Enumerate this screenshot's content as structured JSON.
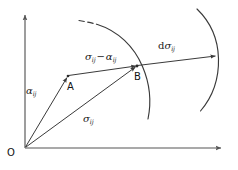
{
  "figure": {
    "background": "#ffffff",
    "stroke_color": "#3a3a3a",
    "axis_color": "#555555",
    "text_color": "#1a1a1a",
    "width": 238,
    "height": 170
  },
  "axes": {
    "origin_label": "O",
    "vertical": {
      "name": "vertical-axis",
      "from": [
        25,
        148
      ],
      "to": [
        25,
        14
      ]
    },
    "horizontal": {
      "name": "horizontal-axis",
      "from": [
        25,
        148
      ],
      "to": [
        222,
        148
      ]
    }
  },
  "points": {
    "origin": {
      "label": "O",
      "x": 25,
      "y": 148
    },
    "a": {
      "label": "A",
      "x": 68,
      "y": 76
    },
    "b": {
      "label": "B",
      "x": 137,
      "y": 66
    }
  },
  "vectors": [
    {
      "name": "alpha-vector",
      "label": "α",
      "subscript": "ij",
      "description": "backstress vector from origin O to point A",
      "from": [
        25,
        148
      ],
      "to": [
        68,
        76
      ],
      "label_pos": [
        28,
        88
      ]
    },
    {
      "name": "sigma-vector",
      "label": "σ",
      "subscript": "ij",
      "description": "stress vector from origin O to point B",
      "from": [
        25,
        148
      ],
      "to": [
        137,
        66
      ],
      "label_pos": [
        84,
        116
      ]
    },
    {
      "name": "sigma-minus-alpha-vector",
      "label_parts": [
        "σ",
        "ij",
        " − ",
        "α",
        "ij"
      ],
      "description": "relative stress vector from A to B",
      "from": [
        68,
        76
      ],
      "to": [
        137,
        66
      ],
      "label_pos": [
        86,
        54
      ]
    },
    {
      "name": "d-sigma-vector",
      "label_parts": [
        "d",
        "σ",
        "ij"
      ],
      "description": "stress increment from B to outer arc",
      "from": [
        137,
        66
      ],
      "to": [
        207,
        57
      ],
      "label_pos": [
        159,
        43
      ]
    }
  ],
  "arcs": [
    {
      "name": "inner-yield-surface-arc",
      "description": "current yield surface passing through point B",
      "style": "solid",
      "dashed_tip": true
    },
    {
      "name": "outer-bounding-surface-arc",
      "description": "bounding surface touched by the stress increment arrow",
      "style": "solid",
      "dashed_tip": false
    }
  ],
  "labels": {
    "origin": "O",
    "point_a": "A",
    "point_b": "B",
    "alpha_ij": "αij",
    "sigma_ij": "σij",
    "sigma_minus_alpha": "σij − αij",
    "d_sigma_ij": "dσij"
  }
}
